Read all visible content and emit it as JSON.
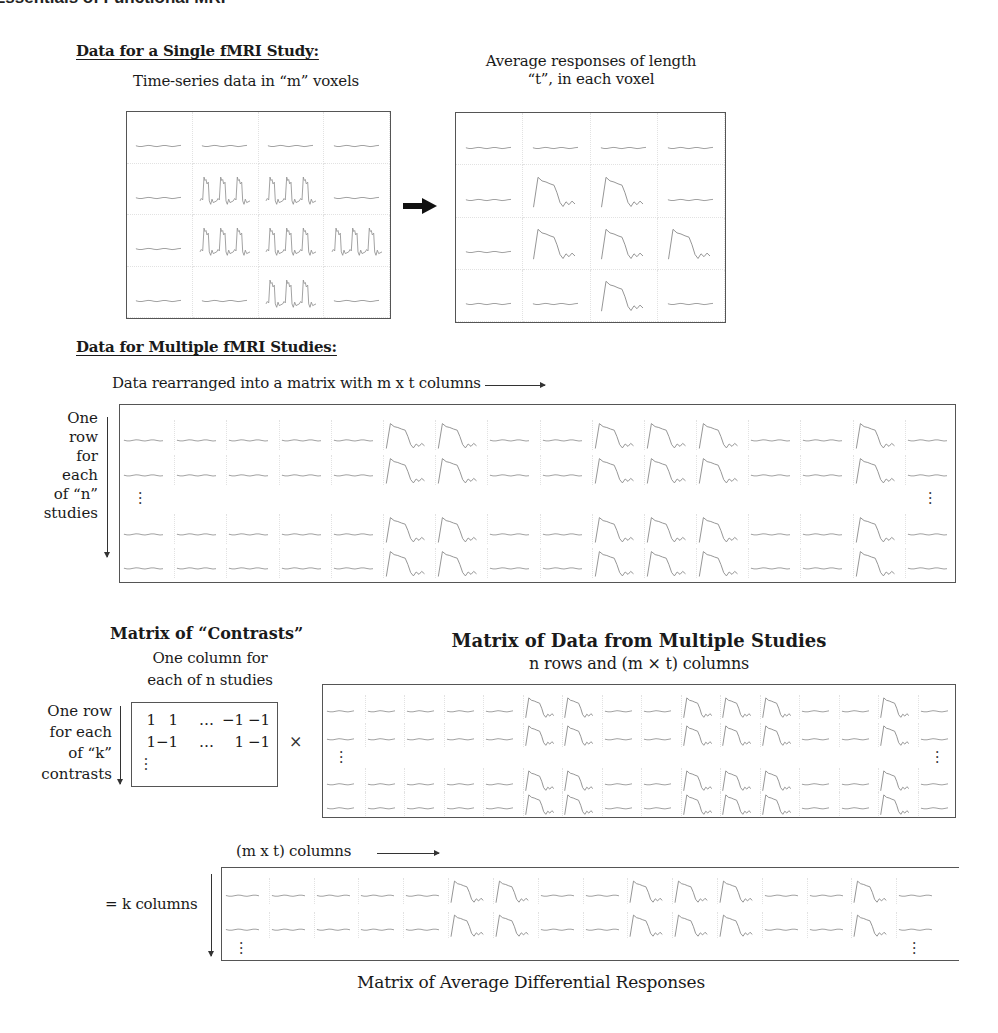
{
  "header": {
    "running_title": "Essentials of Functional MRI"
  },
  "single_study": {
    "title": "Data for a Single fMRI Study:",
    "left_caption": "Time-series data in “m” voxels",
    "right_caption_line1": "Average responses of length",
    "right_caption_line2": "“t”, in each voxel",
    "arrow_icon": "right-arrow-icon",
    "voxel_grid": {
      "rows": 4,
      "cols": 4,
      "active": [
        [
          0,
          0,
          0,
          0
        ],
        [
          0,
          1,
          1,
          0
        ],
        [
          0,
          1,
          1,
          1
        ],
        [
          0,
          0,
          1,
          0
        ]
      ]
    }
  },
  "multiple_studies": {
    "title": "Data for Multiple fMRI Studies:",
    "caption": "Data rearranged into a matrix with m x t columns",
    "row_label_lines": [
      "One",
      "row",
      "for",
      "each",
      "of “n”",
      "studies"
    ],
    "ellipsis": "⋮",
    "matrix": {
      "cols": 16,
      "pattern": [
        0,
        0,
        0,
        0,
        0,
        1,
        1,
        0,
        0,
        1,
        1,
        1,
        0,
        0,
        1,
        0
      ],
      "rows_top": 2,
      "rows_bottom": 2
    }
  },
  "contrasts": {
    "title": "Matrix of “Contrasts”",
    "caption_line1": "One column for",
    "caption_line2": "each of n studies",
    "row_label_lines": [
      "One row",
      "for each",
      "of “k”",
      "contrasts"
    ],
    "rows": [
      [
        "1",
        "1",
        "…",
        "−1",
        "−1"
      ],
      [
        "1",
        "−1",
        "…",
        "1",
        "−1"
      ]
    ],
    "ellipsis": "⋮",
    "times_symbol": "×"
  },
  "data_matrix": {
    "title": "Matrix of Data from Multiple Studies",
    "subtitle": "n rows and (m × t) columns",
    "ellipsis": "⋮"
  },
  "result": {
    "caption": "(m x t) columns",
    "row_label": "= k columns",
    "title": "Matrix of Average Differential Responses",
    "ellipsis": "⋮"
  },
  "colors": {
    "border": "#555555",
    "signal": "#8a8a8a",
    "cell_divider": "#e2e2e2",
    "text": "#1a1a1a"
  }
}
